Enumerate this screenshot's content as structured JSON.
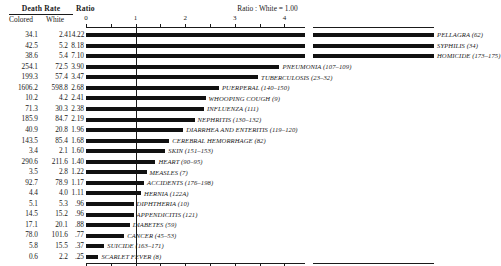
{
  "header": {
    "death_rate_title": "Death Rate",
    "ratio_title": "Ratio",
    "col_colored": "Colored",
    "col_white": "White",
    "caption": "Ratio : White = 1.00"
  },
  "axis": {
    "ticks": [
      "0",
      "1",
      "2",
      "3",
      "4"
    ],
    "tick_values": [
      0,
      1,
      2,
      3,
      4
    ],
    "minor_step": 0.5,
    "break_note": "axis break between 4.4 and 13.7",
    "baseline": 1.0
  },
  "chart_data": {
    "type": "bar",
    "title": "Death Rate",
    "subtitle": "Ratio : White = 1.00",
    "xlabel": "Ratio",
    "ylabel": "",
    "xlim": [
      0,
      4.4
    ],
    "grid": false,
    "legend": "none",
    "orientation": "horizontal",
    "columns": [
      "Colored",
      "White",
      "Ratio",
      "Cause"
    ],
    "categories": [
      "PELLAGRA (62)",
      "SYPHILIS (34)",
      "HOMICIDE (173–175)",
      "PNEUMONIA (107–109)",
      "TUBERCULOSIS (23–32)",
      "PUERPERAL (140–150)",
      "WHOOPING COUGH (9)",
      "INFLUENZA (111)",
      "NEPHRITIS (130–132)",
      "DIARRHEA AND ENTERITIS (119–120)",
      "CEREBRAL HEMORRHAGE (82)",
      "SKIN (151–153)",
      "HEART (90–95)",
      "MEASLES (7)",
      "ACCIDENTS (176–198)",
      "HERNIA (122A)",
      "DIPHTHERIA (10)",
      "APPENDICITIS (121)",
      "DIABETES (59)",
      "CANCER (45–53)",
      "SUICIDE (163–171)",
      "SCARLET FEVER (8)"
    ],
    "values": [
      14.22,
      8.18,
      7.1,
      3.9,
      3.47,
      2.68,
      2.41,
      2.38,
      2.19,
      1.96,
      1.68,
      1.6,
      1.4,
      1.22,
      1.17,
      1.11,
      0.96,
      0.96,
      0.88,
      0.77,
      0.37,
      0.25
    ],
    "series": [
      {
        "name": "Colored",
        "values": [
          34.1,
          42.5,
          38.6,
          254.1,
          199.3,
          1606.2,
          10.2,
          71.3,
          185.9,
          40.9,
          143.5,
          3.4,
          290.6,
          3.5,
          92.7,
          4.4,
          5.1,
          14.5,
          17.1,
          78.0,
          5.8,
          0.6
        ]
      },
      {
        "name": "White",
        "values": [
          2.4,
          5.2,
          5.4,
          72.5,
          57.4,
          598.8,
          4.2,
          30.3,
          84.7,
          20.8,
          85.4,
          2.1,
          211.6,
          2.8,
          78.9,
          4.0,
          5.3,
          15.2,
          20.1,
          101.6,
          15.5,
          2.2
        ]
      }
    ]
  },
  "rows": [
    {
      "colored": "34.1",
      "white": "2.4",
      "ratio": "14.22",
      "label": "PELLAGRA (62)"
    },
    {
      "colored": "42.5",
      "white": "5.2",
      "ratio": "8.18",
      "label": "SYPHILIS (34)"
    },
    {
      "colored": "38.6",
      "white": "5.4",
      "ratio": "7.10",
      "label": "HOMICIDE (173–175)"
    },
    {
      "colored": "254.1",
      "white": "72.5",
      "ratio": "3.90",
      "label": "PNEUMONIA (107–109)"
    },
    {
      "colored": "199.3",
      "white": "57.4",
      "ratio": "3.47",
      "label": "TUBERCULOSIS (23–32)"
    },
    {
      "colored": "1606.2",
      "white": "598.8",
      "ratio": "2.68",
      "label": "PUERPERAL (140–150)"
    },
    {
      "colored": "10.2",
      "white": "4.2",
      "ratio": "2.41",
      "label": "WHOOPING COUGH (9)"
    },
    {
      "colored": "71.3",
      "white": "30.3",
      "ratio": "2.38",
      "label": "INFLUENZA (111)"
    },
    {
      "colored": "185.9",
      "white": "84.7",
      "ratio": "2.19",
      "label": "NEPHRITIS (130–132)"
    },
    {
      "colored": "40.9",
      "white": "20.8",
      "ratio": "1.96",
      "label": "DIARRHEA AND ENTERITIS (119–120)"
    },
    {
      "colored": "143.5",
      "white": "85.4",
      "ratio": "1.68",
      "label": "CEREBRAL HEMORRHAGE (82)"
    },
    {
      "colored": "3.4",
      "white": "2.1",
      "ratio": "1.60",
      "label": "SKIN (151–153)"
    },
    {
      "colored": "290.6",
      "white": "211.6",
      "ratio": "1.40",
      "label": "HEART (90–95)"
    },
    {
      "colored": "3.5",
      "white": "2.8",
      "ratio": "1.22",
      "label": "MEASLES (7)"
    },
    {
      "colored": "92.7",
      "white": "78.9",
      "ratio": "1.17",
      "label": "ACCIDENTS (176–198)"
    },
    {
      "colored": "4.4",
      "white": "4.0",
      "ratio": "1.11",
      "label": "HERNIA (122A)"
    },
    {
      "colored": "5.1",
      "white": "5.3",
      "ratio": ".96",
      "label": "DIPHTHERIA (10)"
    },
    {
      "colored": "14.5",
      "white": "15.2",
      "ratio": ".96",
      "label": "APPENDICITIS (121)"
    },
    {
      "colored": "17.1",
      "white": "20.1",
      "ratio": ".88",
      "label": "DIABETES (59)"
    },
    {
      "colored": "78.0",
      "white": "101.6",
      "ratio": ".77",
      "label": "CANCER (45–53)"
    },
    {
      "colored": "5.8",
      "white": "15.5",
      "ratio": ".37",
      "label": "SUICIDE (163–171)"
    },
    {
      "colored": "0.6",
      "white": "2.2",
      "ratio": ".25",
      "label": "SCARLET FEVER (8)"
    }
  ]
}
